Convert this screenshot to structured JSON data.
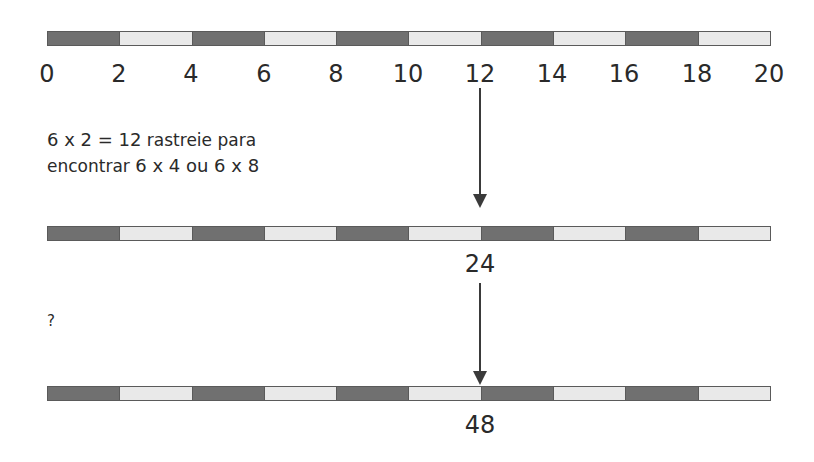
{
  "diagram": {
    "title": "",
    "colors": {
      "dark_segment": "#707070",
      "light_segment": "#e9e9e9",
      "border": "#5a5a5a",
      "text": "#2a2a2a"
    },
    "bars": [
      {
        "id": "bar-1",
        "segments": [
          "dark",
          "light",
          "dark",
          "light",
          "dark",
          "light",
          "dark",
          "light",
          "dark",
          "light"
        ]
      },
      {
        "id": "bar-2",
        "segments": [
          "dark",
          "light",
          "dark",
          "light",
          "dark",
          "light",
          "dark",
          "light",
          "dark",
          "light"
        ]
      },
      {
        "id": "bar-3",
        "segments": [
          "dark",
          "light",
          "dark",
          "light",
          "dark",
          "light",
          "dark",
          "light",
          "dark",
          "light"
        ]
      }
    ],
    "ticks": [
      "0",
      "2",
      "4",
      "6",
      "8",
      "10",
      "12",
      "14",
      "16",
      "18",
      "20"
    ],
    "note": {
      "line1_math": "6 x 2 = 12",
      "line1_text": " rastreie para",
      "line2_text": "encontrar ",
      "line2_math": "6 x 4 ou 6 x 8"
    },
    "label_24": "24",
    "label_48": "48",
    "question": "?"
  }
}
